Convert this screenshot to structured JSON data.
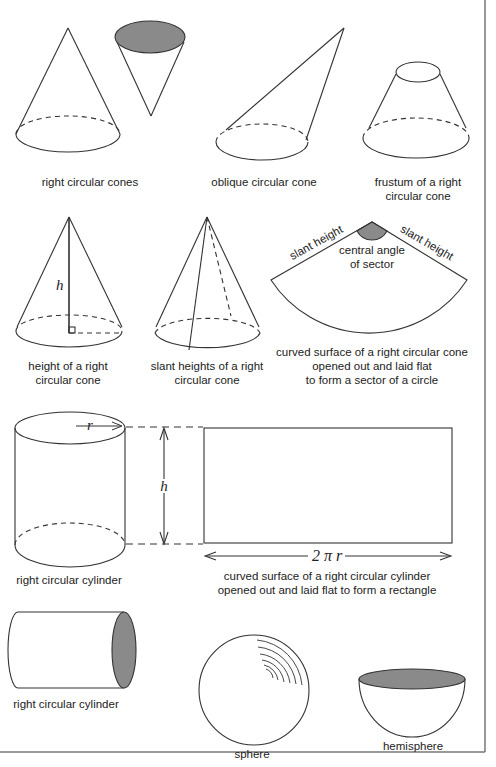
{
  "diagram": {
    "colors": {
      "stroke": "#333333",
      "shade": "#8a8a8a",
      "border": "#777777",
      "background": "#ffffff"
    },
    "captions": {
      "right_circular_cones": "right circular cones",
      "oblique_circular_cone": "oblique circular cone",
      "frustum_line1": "frustum of a right",
      "frustum_line2": "circular cone",
      "height_line1": "height of a right",
      "height_line2": "circular cone",
      "slant_line1": "slant heights of a right",
      "slant_line2": "circular cone",
      "sector_line1": "curved surface of a right circular cone",
      "sector_line2": "opened out and laid flat",
      "sector_line3": "to form a sector of a circle",
      "cylinder1": "right circular cylinder",
      "rectangle_line1": "curved surface of a right circular cylinder",
      "rectangle_line2": "opened out and laid flat to form a rectangle",
      "cylinder2": "right circular cylinder",
      "sphere": "sphere",
      "hemisphere": "hemisphere"
    },
    "labels": {
      "height_symbol": "h",
      "radius_symbol": "r",
      "circumference": "2 π r",
      "slant_height_left": "slant height",
      "slant_height_right": "slant height",
      "central_angle_line1": "central angle",
      "central_angle_line2": "of sector"
    }
  }
}
